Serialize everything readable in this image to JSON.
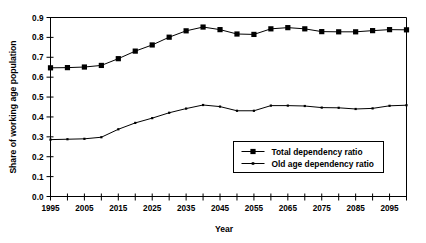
{
  "chart_data": {
    "type": "line",
    "title": "",
    "xlabel": "Year",
    "ylabel": "Share of working age population",
    "xlim": [
      1995,
      2100
    ],
    "ylim": [
      0.0,
      0.9
    ],
    "grid": false,
    "legend_position": "inside-lower-right",
    "x": [
      1995,
      2000,
      2005,
      2010,
      2015,
      2020,
      2025,
      2030,
      2035,
      2040,
      2045,
      2050,
      2055,
      2060,
      2065,
      2070,
      2075,
      2080,
      2085,
      2090,
      2095,
      2100
    ],
    "xtick_labels": [
      "1995",
      "2005",
      "2015",
      "2025",
      "2035",
      "2045",
      "2055",
      "2065",
      "2075",
      "2085",
      "2095"
    ],
    "xtick_values": [
      1995,
      2005,
      2015,
      2025,
      2035,
      2045,
      2055,
      2065,
      2075,
      2085,
      2095
    ],
    "xtick_minor_values": [
      2000,
      2010,
      2020,
      2030,
      2040,
      2050,
      2060,
      2070,
      2080,
      2090,
      2100
    ],
    "ytick_labels": [
      "0.0",
      "0.1",
      "0.2",
      "0.3",
      "0.4",
      "0.5",
      "0.6",
      "0.7",
      "0.8",
      "0.9"
    ],
    "ytick_values": [
      0.0,
      0.1,
      0.2,
      0.3,
      0.4,
      0.5,
      0.6,
      0.7,
      0.8,
      0.9
    ],
    "series": [
      {
        "name": "Total dependency ratio",
        "marker": "square",
        "values": [
          0.647,
          0.648,
          0.651,
          0.659,
          0.693,
          0.731,
          0.762,
          0.801,
          0.833,
          0.852,
          0.839,
          0.817,
          0.815,
          0.843,
          0.849,
          0.843,
          0.829,
          0.828,
          0.828,
          0.834,
          0.839,
          0.838
        ]
      },
      {
        "name": "Old age dependency ratio",
        "marker": "small-square",
        "values": [
          0.286,
          0.288,
          0.29,
          0.298,
          0.338,
          0.37,
          0.394,
          0.421,
          0.442,
          0.46,
          0.452,
          0.431,
          0.431,
          0.457,
          0.457,
          0.455,
          0.447,
          0.446,
          0.44,
          0.443,
          0.456,
          0.459
        ]
      }
    ],
    "legend": [
      {
        "label": "Total dependency ratio",
        "marker": "square"
      },
      {
        "label": "Old age dependency ratio",
        "marker": "small-square"
      }
    ],
    "colors": {
      "series": "#000000",
      "axis": "#000000",
      "background": "#ffffff"
    }
  }
}
